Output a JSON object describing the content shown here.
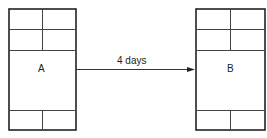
{
  "diagram": {
    "nodes": [
      {
        "id": "A",
        "label": "A"
      },
      {
        "id": "B",
        "label": "B"
      }
    ],
    "edges": [
      {
        "from": "A",
        "to": "B",
        "label": "4 days"
      }
    ]
  }
}
